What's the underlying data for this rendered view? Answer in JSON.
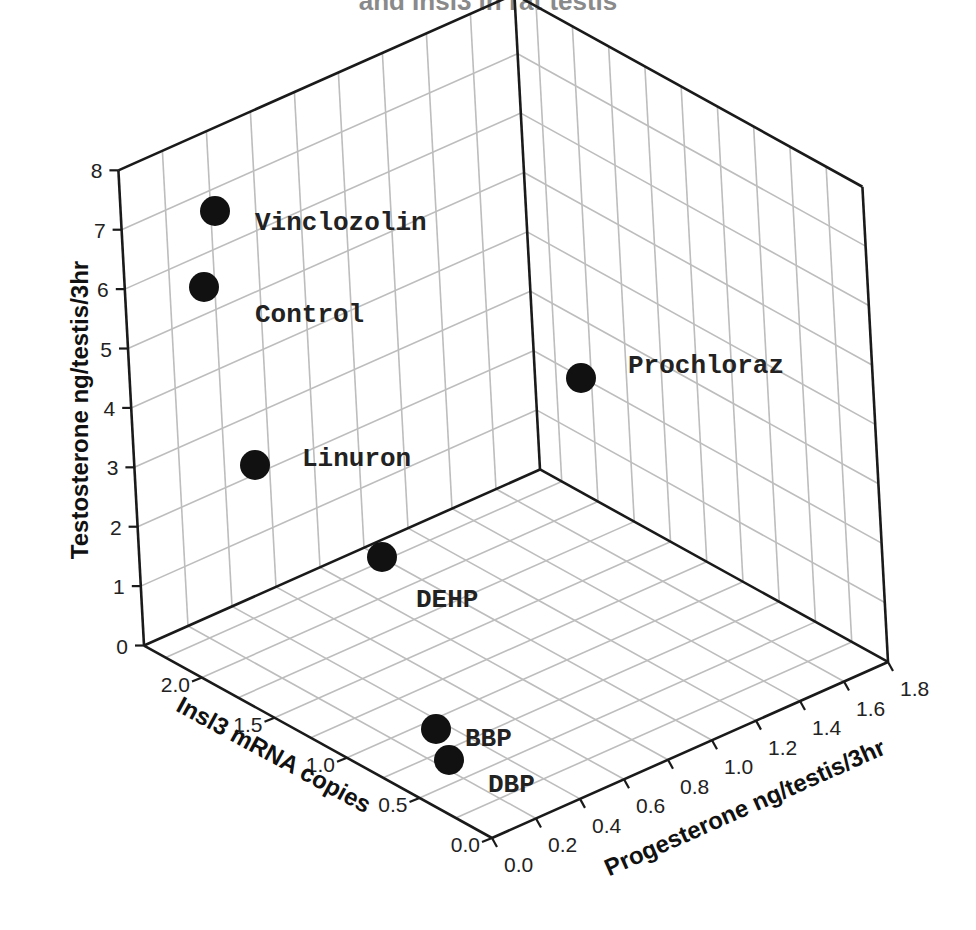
{
  "title_partial": "and Insl3 in rat testis",
  "chart_data": {
    "type": "scatter3d",
    "title": "and Insl3 in rat testis",
    "axes": {
      "z": {
        "label": "Testosterone ng/testis/3hr",
        "range": [
          0,
          8
        ],
        "ticks": [
          "0",
          "1",
          "2",
          "3",
          "4",
          "5",
          "6",
          "7",
          "8"
        ]
      },
      "x": {
        "label": "Progesterone ng/testis/3hr",
        "range": [
          0,
          1.8
        ],
        "ticks": [
          "0.0",
          "0.2",
          "0.4",
          "0.6",
          "0.8",
          "1.0",
          "1.2",
          "1.4",
          "1.6",
          "1.8"
        ]
      },
      "y": {
        "label": "Insl3 mRNA copies",
        "range": [
          0,
          2.4
        ],
        "ticks": [
          "0.0",
          "0.5",
          "1.0",
          "1.5",
          "2.0"
        ]
      }
    },
    "grid": true,
    "legend": "none",
    "points": [
      {
        "name": "Vinclozolin",
        "progesterone": 0.15,
        "insl3": 2.2,
        "testosterone": 7.3
      },
      {
        "name": "Control",
        "progesterone": 0.1,
        "insl3": 2.3,
        "testosterone": 6.2
      },
      {
        "name": "Prochloraz",
        "progesterone": 1.6,
        "insl3": 1.4,
        "testosterone": 3.6
      },
      {
        "name": "Linuron",
        "progesterone": 0.15,
        "insl3": 2.0,
        "testosterone": 3.0
      },
      {
        "name": "DEHP",
        "progesterone": 0.45,
        "insl3": 1.6,
        "testosterone": 1.5
      },
      {
        "name": "BBP",
        "progesterone": 0.2,
        "insl3": 0.55,
        "testosterone": 0.3
      },
      {
        "name": "DBP",
        "progesterone": 0.2,
        "insl3": 0.4,
        "testosterone": 0.15
      }
    ]
  },
  "render": {
    "origin": [
      492,
      838
    ],
    "x_unit": [
      220,
      -97.8
    ],
    "y_unit": [
      -145,
      -80.2
    ],
    "z_unit": [
      -3.2,
      -59.4
    ],
    "x_max": 1.8,
    "y_max": 2.4,
    "z_max": 8,
    "label_px": {
      "Vinclozolin": [
        215,
        211,
        255,
        221
      ],
      "Control": [
        204,
        287,
        255,
        313
      ],
      "Prochloraz": [
        581,
        378,
        628,
        364
      ],
      "Linuron": [
        255,
        465,
        302,
        457
      ],
      "DEHP": [
        382,
        557,
        416,
        598
      ],
      "BBP": [
        436,
        729,
        465,
        737
      ],
      "DBP": [
        449,
        760,
        488,
        783
      ]
    },
    "colors": {
      "grid": "#bdbdbd",
      "edge": "#1a1a1a",
      "dot": "#111111"
    }
  }
}
